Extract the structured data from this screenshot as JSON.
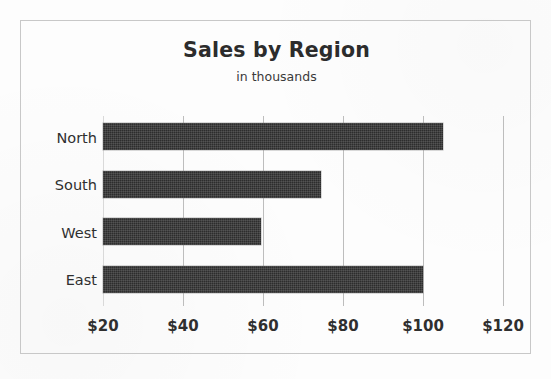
{
  "chart_data": {
    "type": "bar",
    "orientation": "horizontal",
    "title": "Sales by Region",
    "subtitle": "in thousands",
    "xlabel": "",
    "ylabel": "",
    "categories": [
      "North",
      "South",
      "West",
      "East"
    ],
    "values": [
      105,
      74.5,
      59.5,
      100
    ],
    "value_prefix": "$",
    "xlim": [
      20,
      120
    ],
    "xticks": [
      20,
      40,
      60,
      80,
      100,
      120
    ],
    "xticklabels": [
      "$20",
      "$40",
      "$60",
      "$80",
      "$100",
      "$120"
    ],
    "grid": "vertical-only",
    "legend": "none",
    "series": [
      {
        "name": "Sales",
        "color": "#2d2d2d",
        "values": [
          105,
          74.5,
          59.5,
          100
        ]
      }
    ],
    "bars": [
      {
        "category": "North",
        "value": 105
      },
      {
        "category": "South",
        "value": 74.5
      },
      {
        "category": "West",
        "value": 59.5
      },
      {
        "category": "East",
        "value": 100
      }
    ]
  },
  "colors": {
    "bar": "#2d2d2d",
    "gridline": "#bdbdbd",
    "frame_border": "#c8c8c8",
    "background": "#fdfdfd",
    "text": "#2f2f2f"
  }
}
